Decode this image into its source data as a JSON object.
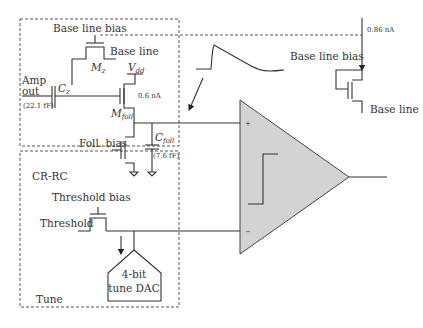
{
  "diagram": {
    "blocks": {
      "crrc": {
        "label": "CR-RC",
        "components": {
          "baseline_bias_label": "Base line bias",
          "baseline_label": "Base line",
          "mz_label": "M",
          "mz_sub": "z",
          "vdd_label": "V",
          "vdd_sub": "dd",
          "amp_out_line1": "Amp",
          "amp_out_line2": "out",
          "cz_label": "C",
          "cz_sub": "z",
          "cz_value": "(22.1 fF)",
          "current_follower": "0.6 nA",
          "mfoll_label": "M",
          "mfoll_sub": "foll",
          "foll_bias_label": "Foll. bias",
          "cfoll_label": "C",
          "cfoll_sub": "foll",
          "cfoll_value": "(7.6 fF)"
        }
      },
      "tune": {
        "label": "Tune",
        "components": {
          "threshold_bias_label": "Threshold bias",
          "threshold_label": "Threshold",
          "dac_line1": "4-bit",
          "dac_line2": "tune DAC"
        }
      },
      "baseline_generator": {
        "current_label": "0.86 nA",
        "bias_label": "Base line bias",
        "output_label": "Base line"
      },
      "comparator": {
        "plus_label": "+",
        "minus_label": "−",
        "fill_color": "#d3d3d3"
      }
    }
  }
}
